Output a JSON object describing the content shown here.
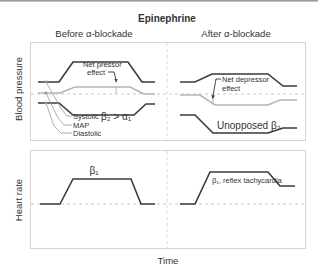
{
  "title": "Epinephrine",
  "columns": {
    "left": "Before α-blockade",
    "right": "After α-blockade"
  },
  "y_labels": {
    "top": "Blood pressure",
    "bottom": "Heart rate"
  },
  "x_label": "Time",
  "annotations": {
    "net_pressor": [
      "Net pressor",
      "effect"
    ],
    "net_depressor": [
      "Net depressor",
      "effect"
    ],
    "beta2_gt_alpha1": "β₂ > α₁",
    "unopposed_beta2": "Unopposed β₂",
    "beta1": "β₁",
    "beta1_reflex": "β₁, reflex tachycardia"
  },
  "legend": {
    "systolic": "Systolic",
    "map": "MAP",
    "diastolic": "Diastolic"
  },
  "colors": {
    "line_dark": "#3a3a3a",
    "line_gray": "#b5b5b5",
    "box": "#d4d4d4",
    "dashed": "#c8c8c8"
  }
}
